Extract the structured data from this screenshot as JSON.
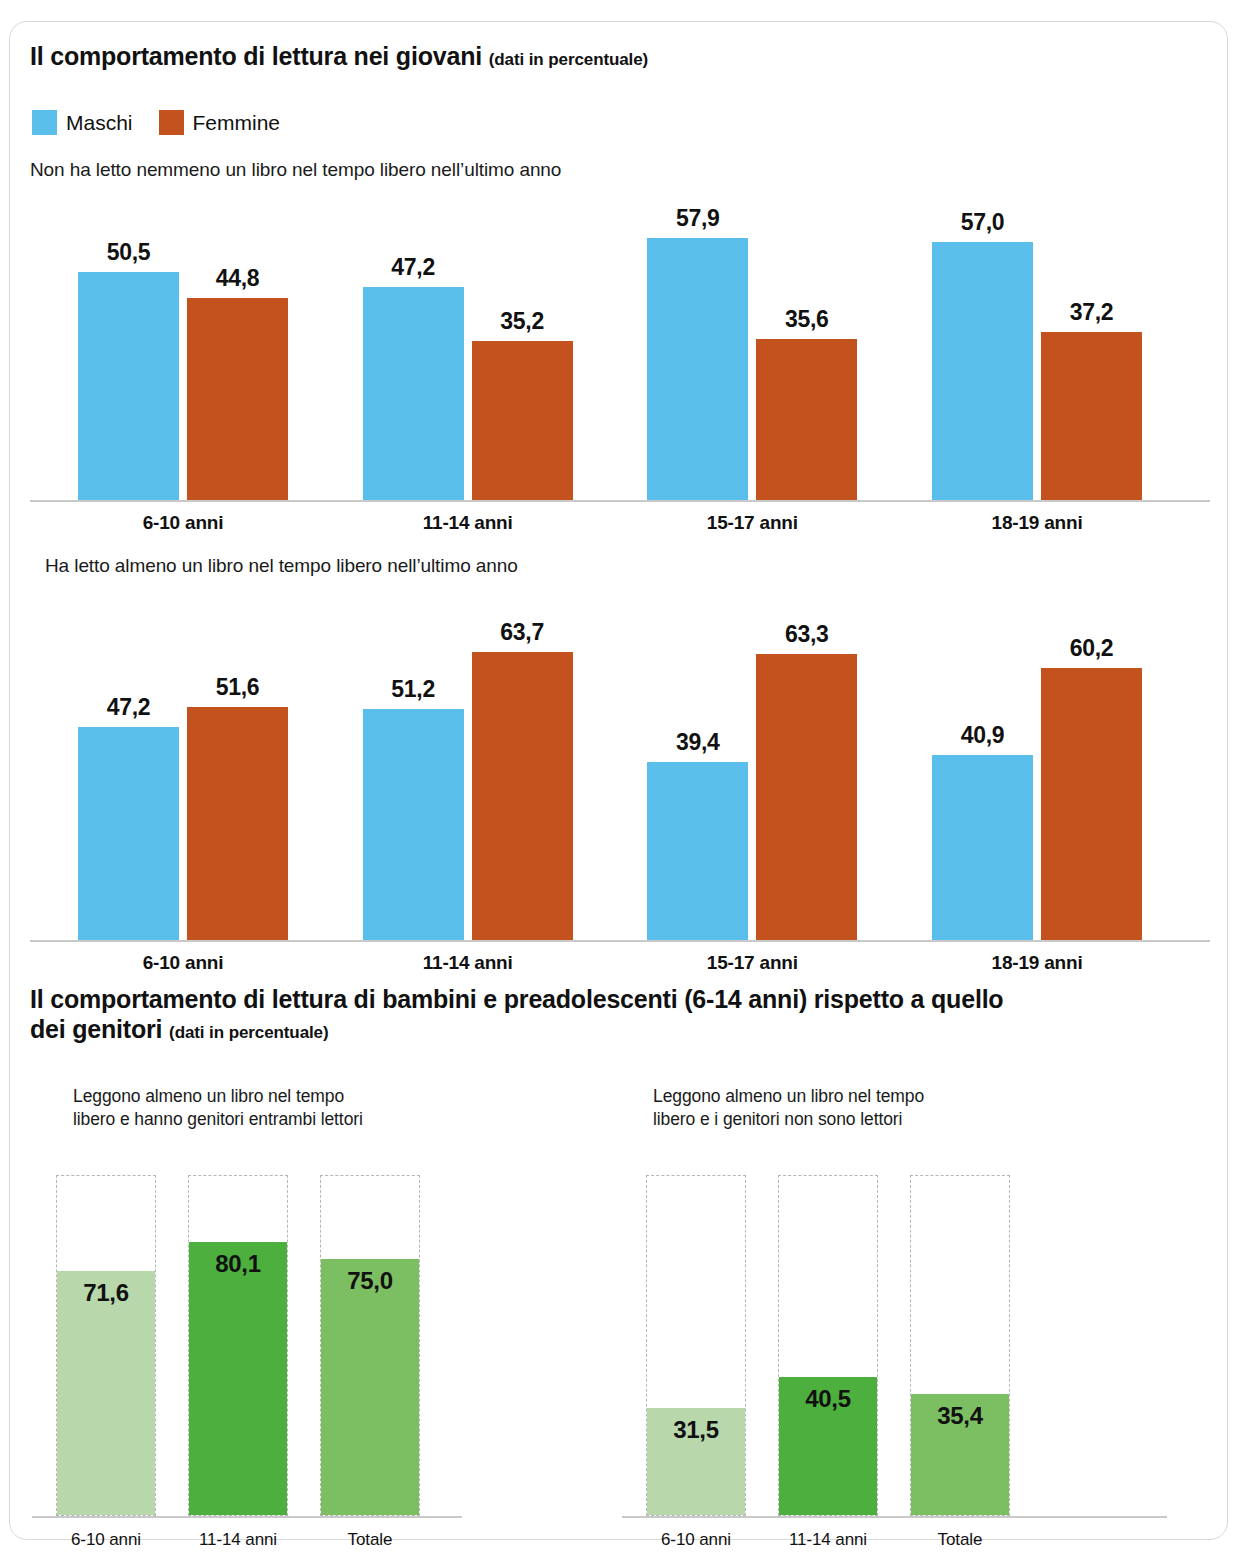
{
  "section1": {
    "title_main": "Il comportamento di lettura nei giovani",
    "title_sub": "(dati in percentuale)",
    "legend": [
      {
        "label": "Maschi",
        "color": "#5bbfec"
      },
      {
        "label": "Femmine",
        "color": "#c3521f"
      }
    ],
    "chart1_caption": "Non ha letto nemmeno un libro nel tempo libero nell’ultimo anno",
    "chart2_caption": "Ha letto almeno un libro nel tempo libero nell’ultimo anno"
  },
  "section2": {
    "title_main": "Il comportamento di lettura di bambini e preadolescenti (6-14 anni) rispetto a quello dei genitori",
    "title_line1": "Il comportamento di lettura di bambini e preadolescenti (6-14 anni) rispetto a quello",
    "title_line2": "dei genitori",
    "title_sub": "(dati in percentuale)",
    "panel_left_caption_line1": "Leggono almeno un libro nel tempo",
    "panel_left_caption_line2": "libero e hanno genitori entrambi lettori",
    "panel_right_caption_line1": "Leggono almeno un libro nel tempo",
    "panel_right_caption_line2": "libero e i genitori non sono lettori"
  },
  "chart_data": [
    {
      "type": "bar",
      "title": "Non ha letto nemmeno un libro nel tempo libero nell’ultimo anno",
      "xlabel": "",
      "ylabel": "percentuale",
      "ylim": [
        0,
        100
      ],
      "grid": false,
      "legend_position": "top-left",
      "categories": [
        "6-10 anni",
        "11-14 anni",
        "15-17 anni",
        "18-19 anni"
      ],
      "series": [
        {
          "name": "Maschi",
          "color": "#5bbfec",
          "values": [
            50.5,
            47.2,
            57.9,
            57.0
          ],
          "labels": [
            "50,5",
            "47,2",
            "57,9",
            "57,0"
          ]
        },
        {
          "name": "Femmine",
          "color": "#c3521f",
          "values": [
            44.8,
            35.2,
            35.6,
            37.2
          ],
          "labels": [
            "44,8",
            "35,2",
            "35,6",
            "37,2"
          ]
        }
      ]
    },
    {
      "type": "bar",
      "title": "Ha letto almeno un libro nel tempo libero nell’ultimo anno",
      "xlabel": "",
      "ylabel": "percentuale",
      "ylim": [
        0,
        100
      ],
      "grid": false,
      "legend_position": "top-left",
      "categories": [
        "6-10 anni",
        "11-14 anni",
        "15-17 anni",
        "18-19 anni"
      ],
      "series": [
        {
          "name": "Maschi",
          "color": "#5bbfec",
          "values": [
            47.2,
            51.2,
            39.4,
            40.9
          ],
          "labels": [
            "47,2",
            "51,2",
            "39,4",
            "40,9"
          ]
        },
        {
          "name": "Femmine",
          "color": "#c3521f",
          "values": [
            51.6,
            63.7,
            63.3,
            60.2
          ],
          "labels": [
            "51,6",
            "63,7",
            "63,3",
            "60,2"
          ]
        }
      ]
    },
    {
      "type": "bar",
      "title": "Leggono almeno un libro nel tempo libero e hanno genitori entrambi lettori",
      "xlabel": "",
      "ylabel": "percentuale",
      "ylim": [
        0,
        100
      ],
      "grid": false,
      "categories": [
        "6-10 anni",
        "11-14 anni",
        "Totale"
      ],
      "values": [
        71.6,
        80.1,
        75.0
      ],
      "labels": [
        "71,6",
        "80,1",
        "75,0"
      ],
      "colors": [
        "#b8d8ac",
        "#4caf3e",
        "#7cbf62"
      ]
    },
    {
      "type": "bar",
      "title": "Leggono almeno un libro nel tempo libero e i genitori non sono lettori",
      "xlabel": "",
      "ylabel": "percentuale",
      "ylim": [
        0,
        100
      ],
      "grid": false,
      "categories": [
        "6-10 anni",
        "11-14 anni",
        "Totale"
      ],
      "values": [
        31.5,
        40.5,
        35.4
      ],
      "labels": [
        "31,5",
        "40,5",
        "35,4"
      ],
      "colors": [
        "#b8d8ac",
        "#4caf3e",
        "#7cbf62"
      ]
    }
  ]
}
